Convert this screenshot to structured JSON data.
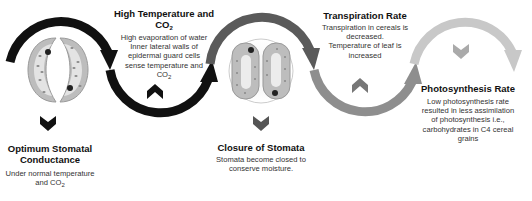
{
  "stages": [
    {
      "id": "optimum",
      "title": "Optimum Stomatal Conductance",
      "title_lines": [
        "Optimum Stomatal",
        "Conductance"
      ],
      "description_lines": [
        "Under normal temperature",
        "and CO",
        "2"
      ],
      "stomata_state": "open",
      "chevron": "down",
      "color": "#111111"
    },
    {
      "id": "high-temp",
      "title_main": "High Temperature and CO",
      "title_sub": "2",
      "description_lines": [
        "High evaporation of water",
        "Inner lateral walls of",
        "epidermal guard cells",
        "sense temperature and",
        "CO",
        "2"
      ],
      "chevron": "up",
      "color": "#111111"
    },
    {
      "id": "closure",
      "title": "Closure of Stomata",
      "description_lines": [
        "Stomata become closed to",
        "conserve moisture."
      ],
      "stomata_state": "closed",
      "chevron": "down",
      "color": "#555555"
    },
    {
      "id": "transpiration",
      "title": "Transpiration Rate",
      "description_lines": [
        "Transpiration in cereals is",
        "decreased.",
        "Temperature of leaf is",
        "increased"
      ],
      "chevron": "up",
      "color": "#8a8a8a"
    },
    {
      "id": "photosynthesis",
      "title": "Photosynthesis Rate",
      "description_lines": [
        "Low photosynthesis rate",
        "resulted in less assimilation",
        "of photosynthesis i.e.,",
        "carbohydrates in C4 cereal",
        "grains"
      ],
      "chevron": "down",
      "color": "#c4c4c4"
    }
  ],
  "colors": {
    "arc1": "#111111",
    "arc2": "#111111",
    "arc3": "#5a5a5a",
    "arc4": "#8e8e8e",
    "arc5": "#c8c8c8",
    "guard_cell": "#bdbdbd",
    "guard_inner": "#e6e6e6"
  }
}
